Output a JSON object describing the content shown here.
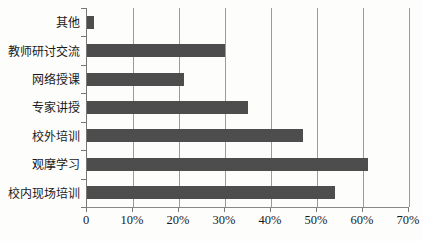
{
  "chart_data": {
    "type": "bar",
    "orientation": "horizontal",
    "title": "",
    "xlabel": "",
    "ylabel": "",
    "categories": [
      "其他",
      "教师研讨交流",
      "网络授课",
      "专家讲授",
      "校外培训",
      "观摩学习",
      "校内现场培训"
    ],
    "values": [
      1.5,
      30,
      21,
      35,
      47,
      61,
      54
    ],
    "value_unit": "percent",
    "xlim": [
      0,
      70
    ],
    "x_tick_values": [
      0,
      10,
      20,
      30,
      40,
      50,
      60,
      70
    ],
    "x_tick_labels": [
      "0",
      "10%",
      "20%",
      "30%",
      "40%",
      "50%",
      "60%",
      "70%"
    ],
    "grid": true,
    "legend": "none",
    "bar_color": "#4d4d4d",
    "gridline_color": "#9b9b9b",
    "axis_color": "#777777",
    "text_color": "#1a1a1a",
    "background_color": "#fdfdfc"
  }
}
